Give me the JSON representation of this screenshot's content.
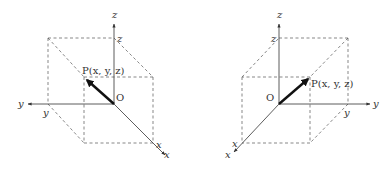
{
  "diagrams": [
    {
      "name": "left-handed-view",
      "axes": {
        "x": "x",
        "y": "y",
        "z": "z"
      },
      "origin_label": "O",
      "point_label": "P(x, y, z)",
      "projection_labels": {
        "x": "x",
        "y": "y",
        "z": "z"
      }
    },
    {
      "name": "right-handed-view",
      "axes": {
        "x": "x",
        "y": "y",
        "z": "z"
      },
      "origin_label": "O",
      "point_label": "P(x, y, z)",
      "projection_labels": {
        "x": "x",
        "y": "y",
        "z": "z"
      }
    }
  ],
  "colors": {
    "axis": "#333333",
    "vector": "#111111",
    "dashed": "#555555",
    "background": "#ffffff"
  }
}
